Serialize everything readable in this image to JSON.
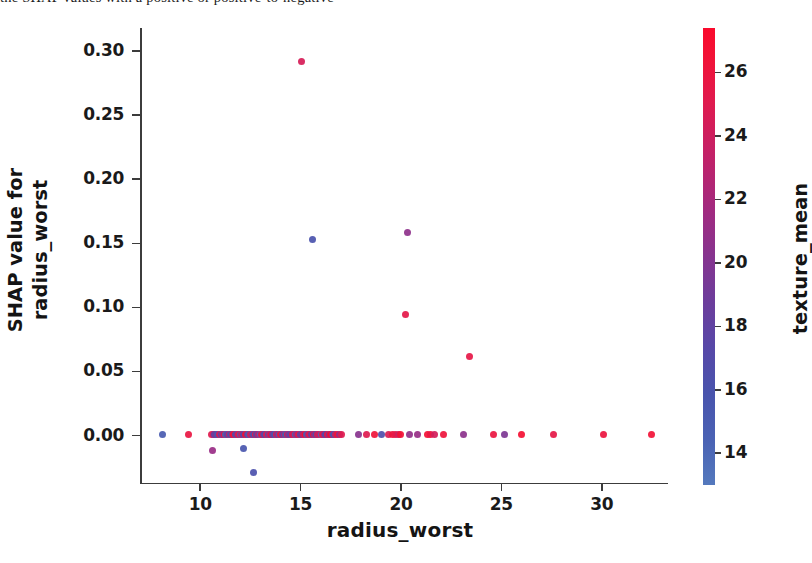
{
  "page": {
    "top_text_sliver": "the SHAP values with a positive or positive-to-negative"
  },
  "chart_data": {
    "type": "scatter",
    "title": "",
    "xlabel": "radius_worst",
    "ylabel": "SHAP value for\nradius_worst",
    "ylabel_line1": "SHAP value for",
    "ylabel_line2": "radius_worst",
    "xlim": [
      7.0,
      33.2
    ],
    "ylim": [
      -0.037,
      0.318
    ],
    "xticks": [
      10,
      15,
      20,
      25,
      30
    ],
    "xtick_labels": [
      "10",
      "15",
      "20",
      "25",
      "30"
    ],
    "yticks": [
      0.0,
      0.05,
      0.1,
      0.15,
      0.2,
      0.25,
      0.3
    ],
    "ytick_labels": [
      "0.00",
      "0.05",
      "0.10",
      "0.15",
      "0.20",
      "0.25",
      "0.30"
    ],
    "grid": false,
    "legend": "none",
    "colorbar": {
      "label": "texture_mean",
      "ticks": [
        14,
        16,
        18,
        20,
        22,
        24,
        26
      ],
      "tick_labels": [
        "14",
        "16",
        "18",
        "20",
        "22",
        "24",
        "26"
      ],
      "vmin": 13.0,
      "vmax": 27.4,
      "cmap": "shap_red_blue",
      "low_color": "#5479bd",
      "mid_color": "#86348f",
      "high_color": "#fa0a2c",
      "orientation": "vertical"
    },
    "point_color_by": "texture_mean",
    "points": [
      {
        "x": 15.03,
        "y": 0.2915,
        "c": 24.5
      },
      {
        "x": 15.58,
        "y": 0.1533,
        "c": 16.0
      },
      {
        "x": 20.31,
        "y": 0.1585,
        "c": 20.6
      },
      {
        "x": 20.24,
        "y": 0.0945,
        "c": 25.4
      },
      {
        "x": 23.42,
        "y": 0.0618,
        "c": 25.6
      },
      {
        "x": 10.63,
        "y": -0.0117,
        "c": 21.2
      },
      {
        "x": 12.18,
        "y": -0.0097,
        "c": 15.7
      },
      {
        "x": 12.65,
        "y": -0.0285,
        "c": 16.2
      },
      {
        "x": 8.12,
        "y": 0.0005,
        "c": 15.2
      },
      {
        "x": 9.42,
        "y": 0.0005,
        "c": 25.8
      },
      {
        "x": 10.58,
        "y": 0.0011,
        "c": 25.1
      },
      {
        "x": 10.66,
        "y": 0.0011,
        "c": 23.6
      },
      {
        "x": 10.72,
        "y": 0.0011,
        "c": 17.9
      },
      {
        "x": 10.8,
        "y": 0.0011,
        "c": 19.4
      },
      {
        "x": 10.88,
        "y": 0.0011,
        "c": 15.4
      },
      {
        "x": 10.95,
        "y": 0.0011,
        "c": 24.8
      },
      {
        "x": 11.04,
        "y": 0.0011,
        "c": 16.3
      },
      {
        "x": 11.12,
        "y": 0.0011,
        "c": 21.8
      },
      {
        "x": 11.2,
        "y": 0.0011,
        "c": 26.2
      },
      {
        "x": 11.28,
        "y": 0.0011,
        "c": 14.5
      },
      {
        "x": 11.36,
        "y": 0.0011,
        "c": 18.6
      },
      {
        "x": 11.44,
        "y": 0.0011,
        "c": 24.1
      },
      {
        "x": 11.52,
        "y": 0.0011,
        "c": 15.9
      },
      {
        "x": 11.6,
        "y": 0.0011,
        "c": 22.7
      },
      {
        "x": 11.68,
        "y": 0.0011,
        "c": 26.5
      },
      {
        "x": 11.76,
        "y": 0.0011,
        "c": 16.8
      },
      {
        "x": 11.84,
        "y": 0.0011,
        "c": 20.2
      },
      {
        "x": 11.92,
        "y": 0.0011,
        "c": 25.3
      },
      {
        "x": 12.0,
        "y": 0.0011,
        "c": 14.9
      },
      {
        "x": 12.08,
        "y": 0.0011,
        "c": 23.2
      },
      {
        "x": 12.16,
        "y": 0.0011,
        "c": 17.4
      },
      {
        "x": 12.25,
        "y": 0.0011,
        "c": 26.8
      },
      {
        "x": 12.34,
        "y": 0.0011,
        "c": 19.8
      },
      {
        "x": 12.42,
        "y": 0.0011,
        "c": 15.1
      },
      {
        "x": 12.5,
        "y": 0.0011,
        "c": 24.4
      },
      {
        "x": 12.58,
        "y": 0.0011,
        "c": 21.5
      },
      {
        "x": 12.66,
        "y": 0.0011,
        "c": 16.5
      },
      {
        "x": 12.74,
        "y": 0.0011,
        "c": 25.9
      },
      {
        "x": 12.82,
        "y": 0.0011,
        "c": 18.1
      },
      {
        "x": 12.9,
        "y": 0.0011,
        "c": 22.3
      },
      {
        "x": 12.98,
        "y": 0.0011,
        "c": 14.2
      },
      {
        "x": 13.06,
        "y": 0.0011,
        "c": 26.1
      },
      {
        "x": 13.14,
        "y": 0.0011,
        "c": 20.7
      },
      {
        "x": 13.22,
        "y": 0.0011,
        "c": 17.0
      },
      {
        "x": 13.3,
        "y": 0.0011,
        "c": 24.9
      },
      {
        "x": 13.38,
        "y": 0.0011,
        "c": 15.6
      },
      {
        "x": 13.46,
        "y": 0.0011,
        "c": 23.0
      },
      {
        "x": 13.54,
        "y": 0.0011,
        "c": 27.0
      },
      {
        "x": 13.62,
        "y": 0.0011,
        "c": 19.1
      },
      {
        "x": 13.7,
        "y": 0.0011,
        "c": 16.1
      },
      {
        "x": 13.78,
        "y": 0.0011,
        "c": 25.5
      },
      {
        "x": 13.86,
        "y": 0.0011,
        "c": 21.0
      },
      {
        "x": 13.94,
        "y": 0.0011,
        "c": 14.7
      },
      {
        "x": 14.02,
        "y": 0.0011,
        "c": 26.6
      },
      {
        "x": 14.1,
        "y": 0.0011,
        "c": 18.4
      },
      {
        "x": 14.18,
        "y": 0.0011,
        "c": 22.9
      },
      {
        "x": 14.26,
        "y": 0.0011,
        "c": 15.3
      },
      {
        "x": 14.34,
        "y": 0.0011,
        "c": 25.0
      },
      {
        "x": 14.42,
        "y": 0.0011,
        "c": 20.0
      },
      {
        "x": 14.5,
        "y": 0.0011,
        "c": 17.6
      },
      {
        "x": 14.58,
        "y": 0.0011,
        "c": 26.3
      },
      {
        "x": 14.66,
        "y": 0.0011,
        "c": 23.8
      },
      {
        "x": 14.74,
        "y": 0.0011,
        "c": 14.4
      },
      {
        "x": 14.82,
        "y": 0.0011,
        "c": 21.3
      },
      {
        "x": 14.9,
        "y": 0.0011,
        "c": 25.7
      },
      {
        "x": 14.98,
        "y": 0.0011,
        "c": 16.9
      },
      {
        "x": 15.06,
        "y": 0.0011,
        "c": 19.5
      },
      {
        "x": 15.14,
        "y": 0.0011,
        "c": 24.2
      },
      {
        "x": 15.22,
        "y": 0.0011,
        "c": 27.1
      },
      {
        "x": 15.3,
        "y": 0.0011,
        "c": 15.0
      },
      {
        "x": 15.38,
        "y": 0.0011,
        "c": 22.1
      },
      {
        "x": 15.46,
        "y": 0.0011,
        "c": 25.2
      },
      {
        "x": 15.54,
        "y": 0.0011,
        "c": 18.0
      },
      {
        "x": 15.62,
        "y": 0.0011,
        "c": 26.9
      },
      {
        "x": 15.7,
        "y": 0.0011,
        "c": 20.4
      },
      {
        "x": 15.78,
        "y": 0.0011,
        "c": 16.4
      },
      {
        "x": 15.86,
        "y": 0.0011,
        "c": 24.6
      },
      {
        "x": 15.94,
        "y": 0.0011,
        "c": 23.4
      },
      {
        "x": 16.02,
        "y": 0.0011,
        "c": 14.1
      },
      {
        "x": 16.1,
        "y": 0.0011,
        "c": 26.0
      },
      {
        "x": 16.18,
        "y": 0.0011,
        "c": 21.6
      },
      {
        "x": 16.26,
        "y": 0.0011,
        "c": 17.2
      },
      {
        "x": 16.34,
        "y": 0.0011,
        "c": 25.6
      },
      {
        "x": 16.42,
        "y": 0.0011,
        "c": 19.0
      },
      {
        "x": 16.5,
        "y": 0.0011,
        "c": 27.2
      },
      {
        "x": 16.58,
        "y": 0.0011,
        "c": 22.5
      },
      {
        "x": 16.66,
        "y": 0.0011,
        "c": 15.8
      },
      {
        "x": 16.74,
        "y": 0.0011,
        "c": 24.0
      },
      {
        "x": 16.84,
        "y": 0.0011,
        "c": 26.4
      },
      {
        "x": 16.94,
        "y": 0.0011,
        "c": 20.9
      },
      {
        "x": 17.05,
        "y": 0.0011,
        "c": 25.1
      },
      {
        "x": 17.9,
        "y": 0.0011,
        "c": 20.3
      },
      {
        "x": 18.3,
        "y": 0.0011,
        "c": 25.0
      },
      {
        "x": 18.66,
        "y": 0.0011,
        "c": 26.3
      },
      {
        "x": 19.05,
        "y": 0.0011,
        "c": 16.7
      },
      {
        "x": 19.4,
        "y": 0.0011,
        "c": 24.7
      },
      {
        "x": 19.58,
        "y": 0.0011,
        "c": 26.1
      },
      {
        "x": 19.72,
        "y": 0.0011,
        "c": 25.4
      },
      {
        "x": 19.86,
        "y": 0.0011,
        "c": 23.9
      },
      {
        "x": 20.0,
        "y": 0.0011,
        "c": 26.6
      },
      {
        "x": 20.44,
        "y": 0.0011,
        "c": 20.8
      },
      {
        "x": 20.8,
        "y": 0.0011,
        "c": 21.1
      },
      {
        "x": 21.3,
        "y": 0.0011,
        "c": 26.7
      },
      {
        "x": 21.48,
        "y": 0.0011,
        "c": 25.8
      },
      {
        "x": 21.66,
        "y": 0.0011,
        "c": 24.3
      },
      {
        "x": 22.1,
        "y": 0.0011,
        "c": 26.2
      },
      {
        "x": 23.1,
        "y": 0.0011,
        "c": 20.5
      },
      {
        "x": 24.6,
        "y": 0.0011,
        "c": 25.9
      },
      {
        "x": 25.15,
        "y": 0.0011,
        "c": 19.7
      },
      {
        "x": 26.0,
        "y": 0.0011,
        "c": 26.8
      },
      {
        "x": 27.6,
        "y": 0.0011,
        "c": 25.5
      },
      {
        "x": 30.1,
        "y": 0.0011,
        "c": 26.0
      },
      {
        "x": 32.5,
        "y": 0.0011,
        "c": 26.5
      }
    ]
  }
}
